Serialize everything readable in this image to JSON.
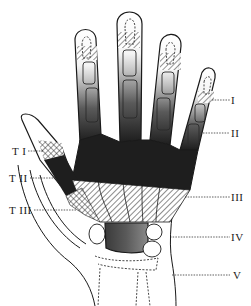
{
  "figure": {
    "zone_labels_right": [
      {
        "id": "I",
        "text": "I"
      },
      {
        "id": "II",
        "text": "II"
      },
      {
        "id": "III",
        "text": "III"
      },
      {
        "id": "IV",
        "text": "IV"
      },
      {
        "id": "V",
        "text": "V"
      }
    ],
    "thumb_zone_labels_left": [
      {
        "id": "TI",
        "text": "T I"
      },
      {
        "id": "TII",
        "text": "T II"
      },
      {
        "id": "TIII",
        "text": "T III"
      }
    ],
    "colors": {
      "ink": "#1a1a1a",
      "dark_zone": "#2a2a2a",
      "mid_zone": "#6a6a6a",
      "light_zone": "#bdbdbd",
      "background": "#ffffff"
    }
  }
}
